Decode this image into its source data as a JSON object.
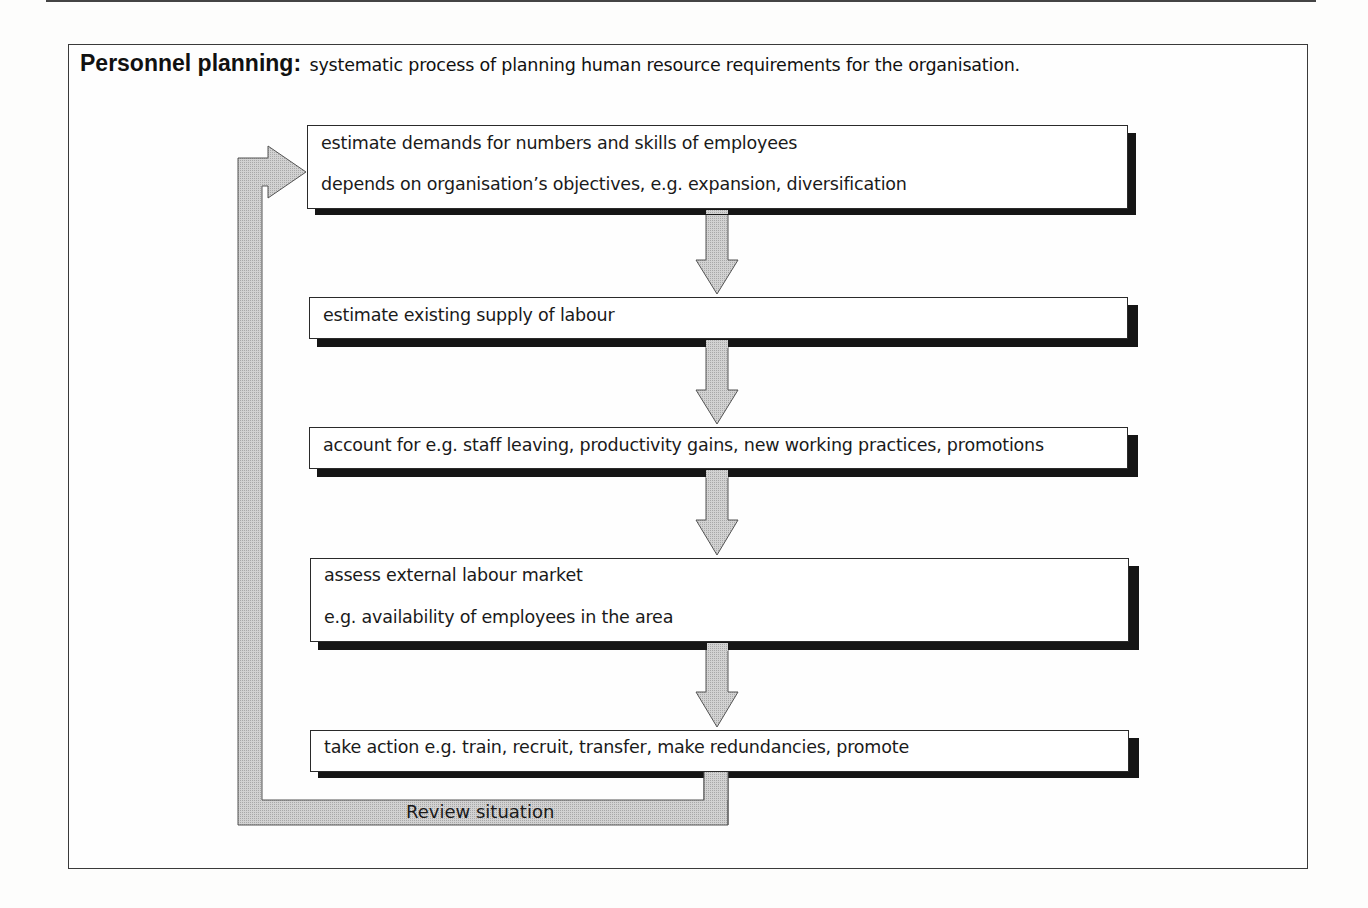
{
  "diagram": {
    "title": "Personnel planning:",
    "definition": "systematic process of planning human resource requirements for the organisation.",
    "steps": [
      {
        "lines": [
          "estimate demands for numbers and skills of employees",
          "depends on organisation’s objectives, e.g. expansion, diversification"
        ]
      },
      {
        "lines": [
          "estimate existing supply of labour"
        ]
      },
      {
        "lines": [
          "account for e.g. staff leaving, productivity gains, new working practices, promotions"
        ]
      },
      {
        "lines": [
          "assess external labour market",
          "e.g. availability of employees in the area"
        ]
      },
      {
        "lines": [
          "take action e.g. train, recruit, transfer, make redundancies, promote"
        ]
      }
    ],
    "feedback_label": "Review situation",
    "colors": {
      "arrow_fill": "#c8c8c8",
      "arrow_stroke": "#555555",
      "shadow": "#151515",
      "border": "#2a2a2a"
    }
  }
}
